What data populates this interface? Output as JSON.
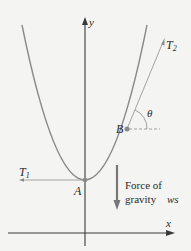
{
  "diagram": {
    "background": "#f4f4f2",
    "colors": {
      "curve": "#8a8a8a",
      "axis": "#3a3a3a",
      "tension_line": "#9a9a9a",
      "point": "#8a8a8a",
      "text": "#2a2a2a",
      "gravity_arrow": "#777777"
    },
    "axes": {
      "x_label": "x",
      "y_label": "y"
    },
    "points": {
      "A": {
        "label": "A",
        "x": 85,
        "y": 180
      },
      "B": {
        "label": "B",
        "x": 127,
        "y": 129
      }
    },
    "forces": {
      "T1": {
        "label": "T",
        "subscript": "1",
        "direction": "horizontal-left"
      },
      "T2": {
        "label": "T",
        "subscript": "2",
        "direction": "tangent-at-B"
      },
      "gravity": {
        "line1": "Force of",
        "line2": "gravity",
        "symbol": "ws",
        "direction": "down"
      }
    },
    "angle": {
      "label": "θ",
      "between": "T2 and horizontal at B"
    }
  }
}
